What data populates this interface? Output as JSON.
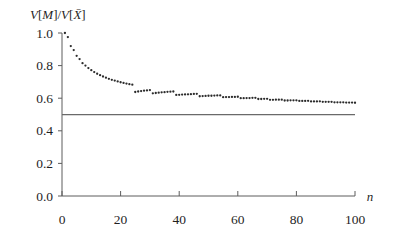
{
  "chart_data": {
    "type": "scatter",
    "title": "",
    "subtitle": "",
    "xlabel": "n",
    "ylabel": "V[M]/V[X̄]",
    "ylabel_parts": {
      "v1": "V",
      "lb1": "[",
      "m": "M",
      "rb1": "]",
      "slash": "/",
      "v2": "V",
      "lb2": "[",
      "xbar": "X̄",
      "rb2": "]"
    },
    "xlim": [
      0,
      100
    ],
    "ylim": [
      0.0,
      1.0
    ],
    "xticks": [
      0,
      20,
      40,
      60,
      80,
      100
    ],
    "yticks": [
      0.0,
      0.2,
      0.4,
      0.6,
      0.8,
      1.0
    ],
    "xtick_labels": [
      "0",
      "20",
      "40",
      "60",
      "80",
      "100"
    ],
    "ytick_labels": [
      "0.0",
      "0.2",
      "0.4",
      "0.6",
      "0.8",
      "1.0"
    ],
    "grid": false,
    "legend": false,
    "legend_position": "none",
    "series": [
      {
        "name": "V[M]/V[Xbar]",
        "style": "dotted-points",
        "marker": "dot",
        "color": "#2b2b2b",
        "x": [
          1,
          2,
          3,
          4,
          5,
          6,
          7,
          8,
          9,
          10,
          11,
          12,
          13,
          14,
          15,
          16,
          17,
          18,
          19,
          20,
          21,
          22,
          23,
          24,
          25,
          26,
          27,
          28,
          29,
          30,
          31,
          32,
          33,
          34,
          35,
          36,
          37,
          38,
          39,
          40,
          41,
          42,
          43,
          44,
          45,
          46,
          47,
          48,
          49,
          50,
          51,
          52,
          53,
          54,
          55,
          56,
          57,
          58,
          59,
          60,
          61,
          62,
          63,
          64,
          65,
          66,
          67,
          68,
          69,
          70,
          71,
          72,
          73,
          74,
          75,
          76,
          77,
          78,
          79,
          80,
          81,
          82,
          83,
          84,
          85,
          86,
          87,
          88,
          89,
          90,
          91,
          92,
          93,
          94,
          95,
          96,
          97,
          98,
          99,
          100
        ],
        "y": [
          1.0,
          0.975,
          0.92,
          0.895,
          0.86,
          0.84,
          0.815,
          0.8,
          0.785,
          0.772,
          0.76,
          0.75,
          0.741,
          0.733,
          0.726,
          0.719,
          0.713,
          0.708,
          0.703,
          0.698,
          0.694,
          0.69,
          0.686,
          0.683,
          0.638,
          0.641,
          0.644,
          0.646,
          0.648,
          0.65,
          0.63,
          0.632,
          0.634,
          0.636,
          0.637,
          0.639,
          0.64,
          0.641,
          0.62,
          0.621,
          0.622,
          0.623,
          0.624,
          0.625,
          0.626,
          0.627,
          0.612,
          0.613,
          0.614,
          0.615,
          0.615,
          0.616,
          0.617,
          0.617,
          0.606,
          0.607,
          0.607,
          0.608,
          0.608,
          0.609,
          0.6,
          0.6,
          0.601,
          0.601,
          0.602,
          0.602,
          0.595,
          0.595,
          0.596,
          0.596,
          0.59,
          0.59,
          0.591,
          0.591,
          0.591,
          0.586,
          0.586,
          0.587,
          0.587,
          0.587,
          0.583,
          0.583,
          0.583,
          0.584,
          0.58,
          0.58,
          0.58,
          0.581,
          0.578,
          0.578,
          0.578,
          0.578,
          0.575,
          0.575,
          0.575,
          0.575,
          0.573,
          0.573,
          0.573,
          0.572
        ]
      }
    ],
    "reference_lines": [
      {
        "name": "half-level",
        "orientation": "horizontal",
        "value": 0.5,
        "style": "solid",
        "color": "#6a6a6a",
        "x_start": 0,
        "x_end": 100
      }
    ],
    "colors": {
      "background": "#ffffff",
      "axis": "#5d5d5d",
      "data": "#2b2b2b",
      "reference": "#6a6a6a",
      "text": "#1f1f1f"
    }
  }
}
